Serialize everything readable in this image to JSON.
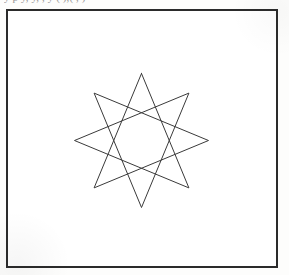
{
  "page": {
    "background_color": "#fdfdfc",
    "width": 289,
    "height": 275
  },
  "clipped_header": {
    "text": "y     p     y,          y,    ,     y  (            ),(        ,          )",
    "note": "line of text cropped at the top edge of the scan; only descender fragments are legible"
  },
  "figure_frame": {
    "border_color": "#2b2b2b",
    "border_width": 2,
    "fill_color": "#ffffff",
    "left": 6,
    "top": 9,
    "width": 272,
    "height": 259
  },
  "figure": {
    "name": "eight-pointed-star-polygon",
    "schlafli_symbol": "{8/3}",
    "points": 8,
    "step": 3,
    "stroke_color": "#3a3a3a",
    "stroke_width": 1,
    "fill": "none",
    "center_x": 141.5,
    "center_y": 140.5,
    "radius": 67,
    "start_angle_deg": -90,
    "vertices": [
      {
        "index": 0,
        "angle_deg": -90,
        "x": 141.5,
        "y": 73.5
      },
      {
        "index": 1,
        "angle_deg": -45,
        "x": 188.9,
        "y": 93.1
      },
      {
        "index": 2,
        "angle_deg": 0,
        "x": 208.5,
        "y": 140.5
      },
      {
        "index": 3,
        "angle_deg": 45,
        "x": 188.9,
        "y": 187.9
      },
      {
        "index": 4,
        "angle_deg": 90,
        "x": 141.5,
        "y": 207.5
      },
      {
        "index": 5,
        "angle_deg": 135,
        "x": 94.1,
        "y": 187.9
      },
      {
        "index": 6,
        "angle_deg": 180,
        "x": 74.5,
        "y": 140.5
      },
      {
        "index": 7,
        "angle_deg": 225,
        "x": 94.1,
        "y": 93.1
      }
    ],
    "draw_order": [
      0,
      3,
      6,
      1,
      4,
      7,
      2,
      5,
      0
    ]
  }
}
